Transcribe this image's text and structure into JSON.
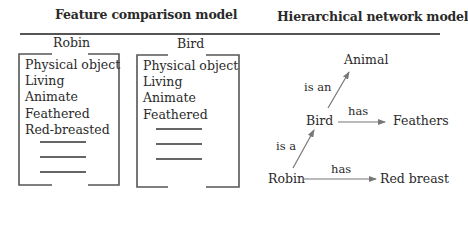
{
  "feature_comparison": {
    "title": "Feature comparison model",
    "robin": {
      "label": "Robin",
      "features": [
        "Physical object",
        "Living",
        "Animate",
        "Feathered",
        "Red-breasted"
      ],
      "blank_lines": 3
    },
    "bird": {
      "label": "Bird",
      "features": [
        "Physical object",
        "Living",
        "Animate",
        "Feathered"
      ],
      "blank_lines": 3
    }
  },
  "hierarchical_network": {
    "title": "Hierarchical network model",
    "nodes": {
      "animal": "Animal",
      "bird": "Bird",
      "feathers": "Feathers",
      "robin": "Robin",
      "red_breast": "Red breast"
    },
    "edges": {
      "bird_animal": "is an",
      "bird_feathers": "has",
      "robin_bird": "is a",
      "robin_red_breast": "has"
    }
  }
}
